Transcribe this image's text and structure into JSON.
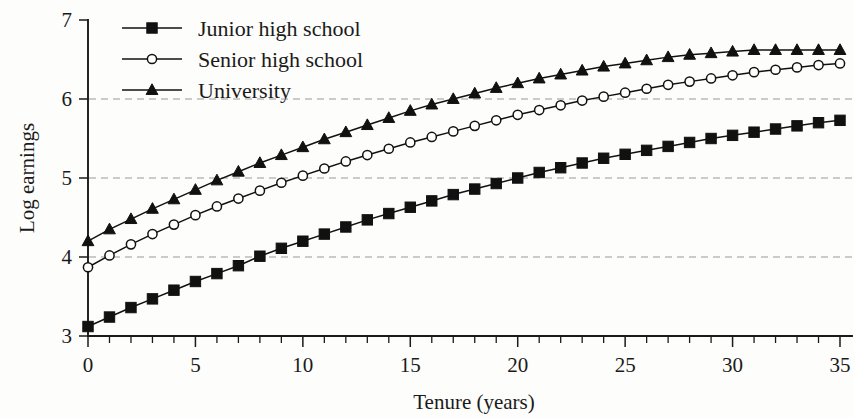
{
  "chart_data": {
    "type": "line",
    "title": "",
    "xlabel": "Tenure (years)",
    "ylabel": "Log earnings",
    "xlim": [
      0,
      35
    ],
    "ylim": [
      3,
      7
    ],
    "xticks": [
      0,
      5,
      10,
      15,
      20,
      25,
      30,
      35
    ],
    "xtick_labels": [
      "0",
      "5",
      "10",
      "15",
      "20",
      "25",
      "30",
      "35"
    ],
    "xtick_minor_step": 1,
    "yticks": [
      3,
      4,
      5,
      6,
      7
    ],
    "ytick_labels": [
      "3",
      "4",
      "5",
      "6",
      "7"
    ],
    "grid": "horizontal dashed at y = 4, 5, 6",
    "gridlines_y": [
      4,
      5,
      6
    ],
    "legend_position": "upper left inside",
    "x": [
      0,
      1,
      2,
      3,
      4,
      5,
      6,
      7,
      8,
      9,
      10,
      11,
      12,
      13,
      14,
      15,
      16,
      17,
      18,
      19,
      20,
      21,
      22,
      23,
      24,
      25,
      26,
      27,
      28,
      29,
      30,
      31,
      32,
      33,
      34,
      35
    ],
    "series": [
      {
        "name": "Junior high school",
        "marker": "filled-square",
        "values": [
          3.12,
          3.24,
          3.36,
          3.47,
          3.58,
          3.69,
          3.79,
          3.89,
          4.01,
          4.11,
          4.2,
          4.29,
          4.38,
          4.47,
          4.55,
          4.63,
          4.71,
          4.79,
          4.86,
          4.93,
          5.0,
          5.07,
          5.13,
          5.19,
          5.25,
          5.3,
          5.35,
          5.4,
          5.45,
          5.5,
          5.54,
          5.58,
          5.62,
          5.66,
          5.7,
          5.73
        ]
      },
      {
        "name": "Senior high school",
        "marker": "open-circle",
        "values": [
          3.87,
          4.02,
          4.16,
          4.29,
          4.41,
          4.53,
          4.64,
          4.74,
          4.84,
          4.94,
          5.03,
          5.12,
          5.21,
          5.29,
          5.37,
          5.45,
          5.52,
          5.59,
          5.66,
          5.73,
          5.8,
          5.86,
          5.92,
          5.98,
          6.03,
          6.08,
          6.13,
          6.18,
          6.22,
          6.26,
          6.3,
          6.34,
          6.37,
          6.4,
          6.43,
          6.45
        ]
      },
      {
        "name": "University",
        "marker": "filled-triangle",
        "values": [
          4.2,
          4.35,
          4.48,
          4.61,
          4.73,
          4.85,
          4.97,
          5.08,
          5.19,
          5.29,
          5.39,
          5.49,
          5.58,
          5.67,
          5.76,
          5.85,
          5.93,
          6.0,
          6.07,
          6.14,
          6.2,
          6.26,
          6.31,
          6.36,
          6.41,
          6.45,
          6.49,
          6.53,
          6.56,
          6.58,
          6.6,
          6.62,
          6.62,
          6.62,
          6.62,
          6.62
        ]
      }
    ]
  },
  "legend": {
    "items": [
      {
        "label": "Junior high school",
        "marker": "filled-square"
      },
      {
        "label": "Senior high school",
        "marker": "open-circle"
      },
      {
        "label": "University",
        "marker": "filled-triangle"
      }
    ]
  },
  "colors": {
    "ink": "#111111",
    "background": "#fdfdfb",
    "grid": "#9a9a9a"
  }
}
